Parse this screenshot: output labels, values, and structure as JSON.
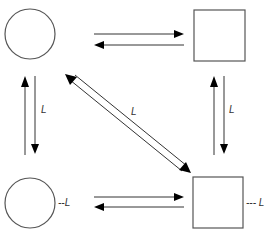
{
  "diagram": {
    "nodes": [
      {
        "id": "top-left",
        "shape": "circle"
      },
      {
        "id": "top-right",
        "shape": "square"
      },
      {
        "id": "bottom-left",
        "shape": "circle",
        "annotation": "--L"
      },
      {
        "id": "bottom-right",
        "shape": "square",
        "annotation": "--- L"
      }
    ],
    "labels": {
      "left_vertical": "L",
      "right_vertical": "L",
      "diagonal": "L",
      "bottom_left_annotation": "--L",
      "bottom_right_annotation": "--- L"
    },
    "edges": [
      {
        "from": "top-left",
        "to": "top-right",
        "type": "bidirectional-pair"
      },
      {
        "from": "top-left",
        "to": "bottom-left",
        "type": "bidirectional-pair",
        "label": "L"
      },
      {
        "from": "top-right",
        "to": "bottom-right",
        "type": "bidirectional-pair",
        "label": "L"
      },
      {
        "from": "top-left",
        "to": "bottom-right",
        "type": "bidirectional-pair",
        "label": "L"
      },
      {
        "from": "bottom-left",
        "to": "bottom-right",
        "type": "bidirectional-pair"
      }
    ],
    "colors": {
      "stroke": "#555555",
      "arrowhead": "#000000",
      "background": "#ffffff"
    }
  }
}
